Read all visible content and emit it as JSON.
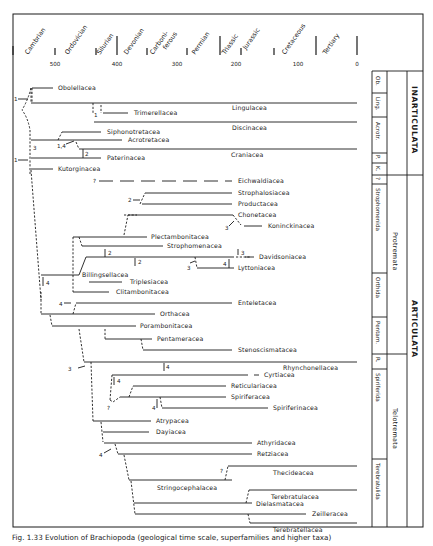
{
  "figure": {
    "caption": "Fig. 1.33  Evolution of Brachiopoda (geological time scale, superfamilies and higher taxa)",
    "time_axis": {
      "unit": "Ma",
      "ticks": [
        {
          "label": "500",
          "value": 500
        },
        {
          "label": "400",
          "value": 400
        },
        {
          "label": "300",
          "value": 300
        },
        {
          "label": "200",
          "value": 200
        },
        {
          "label": "100",
          "value": 100
        },
        {
          "label": "0",
          "value": 0
        }
      ],
      "periods": [
        {
          "name": "Cambrian"
        },
        {
          "name": "Ordovician"
        },
        {
          "name": "Silurian"
        },
        {
          "name": "Devonian"
        },
        {
          "name": "Carboni-",
          "name2": "ferous"
        },
        {
          "name": "Permian"
        },
        {
          "name": "Triassic"
        },
        {
          "name": "Jurassic"
        },
        {
          "name": "Cretaceous"
        },
        {
          "name": "Tertiary"
        }
      ]
    },
    "taxa": [
      {
        "name": "Obolellacea"
      },
      {
        "name": "Lingulacea"
      },
      {
        "name": "Trimerellacea"
      },
      {
        "name": "Discinacea"
      },
      {
        "name": "Siphonotretacea"
      },
      {
        "name": "Acrotretacea"
      },
      {
        "name": "Craniacea"
      },
      {
        "name": "Paterinacea"
      },
      {
        "name": "Kutorginacea"
      },
      {
        "name": "Eichwaldiacea"
      },
      {
        "name": "Strophalosiacea"
      },
      {
        "name": "Productacea"
      },
      {
        "name": "Chonetacea"
      },
      {
        "name": "Koninckinacea"
      },
      {
        "name": "Plectambonitacea"
      },
      {
        "name": "Strophomenacea"
      },
      {
        "name": "Davidsoniacea"
      },
      {
        "name": "Lyttoniacea"
      },
      {
        "name": "Billingsellacea"
      },
      {
        "name": "Triplesiacea"
      },
      {
        "name": "Clitambonitacea"
      },
      {
        "name": "Enteletacea"
      },
      {
        "name": "Orthacea"
      },
      {
        "name": "Porambonitacea"
      },
      {
        "name": "Pentameracea"
      },
      {
        "name": "Stenoscismatacea"
      },
      {
        "name": "Rhynchonellacea"
      },
      {
        "name": "Cyrtiacea"
      },
      {
        "name": "Reticulariacea"
      },
      {
        "name": "Spiriferacea"
      },
      {
        "name": "Spiriferinacea"
      },
      {
        "name": "Atrypacea"
      },
      {
        "name": "Dayiacea"
      },
      {
        "name": "Athyridacea"
      },
      {
        "name": "Retziacea"
      },
      {
        "name": "Thecideacea"
      },
      {
        "name": "Stringocephalacea"
      },
      {
        "name": "Terebratulacea"
      },
      {
        "name": "Dielasmatacea"
      },
      {
        "name": "Zeilleracea"
      },
      {
        "name": "Terebratellacea"
      }
    ],
    "annotations": [
      "1",
      "1",
      "1",
      "3",
      "1,4",
      "2",
      "?",
      "2",
      "3",
      "2",
      "2",
      "3",
      "3",
      "4",
      "4",
      "4",
      "3",
      "4",
      "4",
      "?",
      "4",
      "4",
      "?"
    ],
    "orders": [
      {
        "label": "Ob."
      },
      {
        "label": "Ling."
      },
      {
        "label": "Acrotr."
      },
      {
        "label": "P."
      },
      {
        "label": "K."
      },
      {
        "label": "?"
      },
      {
        "label": "Strophomenida"
      },
      {
        "label": "Orthida"
      },
      {
        "label": "Pentam."
      },
      {
        "label": "R."
      },
      {
        "label": "Spiriferida"
      },
      {
        "label": "Terebratulida"
      }
    ],
    "subclasses": [
      {
        "label": "Protremata"
      },
      {
        "label": "Telotremata"
      }
    ],
    "classes": [
      {
        "label": "INARTICULATA"
      },
      {
        "label": "ARTICULATA"
      }
    ]
  }
}
